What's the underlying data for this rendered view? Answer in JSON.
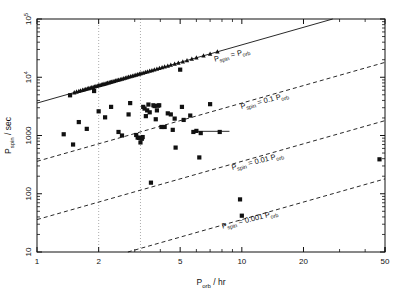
{
  "chart_data": {
    "type": "scatter",
    "title": "",
    "xlabel": "P_orb / hr",
    "ylabel": "P_spin / sec",
    "xlabel_parts": {
      "base": "P",
      "sub": "orb",
      "unit": "/ hr"
    },
    "ylabel_parts": {
      "base": "P",
      "sub": "spin",
      "unit": "/ sec"
    },
    "xscale": "log",
    "yscale": "log",
    "xlim": [
      1,
      50
    ],
    "ylim": [
      10,
      100000
    ],
    "grid": false,
    "legend": "none",
    "xticks": [
      1,
      2,
      5,
      10,
      20,
      50
    ],
    "xticklabels": [
      "1",
      "2",
      "5",
      "10",
      "20",
      "50"
    ],
    "yticks": [
      10,
      100,
      1000,
      10000,
      100000
    ],
    "yticklabels": [
      "10",
      "100",
      "1000",
      "10⁴",
      "10⁵"
    ],
    "annotations": [
      {
        "text": "P_spin = P_orb",
        "base": "P",
        "sub": "spin",
        "op": "=",
        "coef": "",
        "base2": "P",
        "sub2": "orb",
        "x": 9.0,
        "y": 22000,
        "rotation": -14
      },
      {
        "text": "P_spin = 0.1 P_orb",
        "base": "P",
        "sub": "spin",
        "op": "=",
        "coef": "0.1",
        "base2": "P",
        "sub2": "orb",
        "x": 13.0,
        "y": 3600,
        "rotation": -14
      },
      {
        "text": "P_spin = 0.01 P_orb",
        "base": "P",
        "sub": "spin",
        "op": "=",
        "coef": "0.01",
        "base2": "P",
        "sub2": "orb",
        "x": 12.0,
        "y": 330,
        "rotation": -14
      },
      {
        "text": "P_spin = 0.001 P_orb",
        "base": "P",
        "sub": "spin",
        "op": "=",
        "coef": "0.001",
        "base2": "P",
        "sub2": "orb",
        "x": 11.0,
        "y": 33,
        "rotation": -14
      }
    ],
    "reference_lines": [
      {
        "name": "P_spin = P_orb",
        "style": "solid",
        "ratio": 1.0
      },
      {
        "name": "P_spin = 0.1 P_orb",
        "style": "dashed",
        "ratio": 0.1
      },
      {
        "name": "P_spin = 0.01 P_orb",
        "style": "dashed",
        "ratio": 0.01
      },
      {
        "name": "P_spin = 0.001 P_orb",
        "style": "dashed",
        "ratio": 0.001
      }
    ],
    "period_gap": {
      "style": "dotted",
      "x_low": 2.0,
      "x_high": 3.2
    },
    "series": [
      {
        "name": "synchronous systems (triangles)",
        "marker": "triangle",
        "points": [
          [
            1.52,
            5450
          ],
          [
            1.56,
            5620
          ],
          [
            1.6,
            5760
          ],
          [
            1.63,
            5880
          ],
          [
            1.67,
            6020
          ],
          [
            1.7,
            6130
          ],
          [
            1.73,
            6240
          ],
          [
            1.76,
            6340
          ],
          [
            1.79,
            6450
          ],
          [
            1.82,
            6550
          ],
          [
            1.85,
            6660
          ],
          [
            1.88,
            6770
          ],
          [
            1.91,
            6880
          ],
          [
            1.94,
            6990
          ],
          [
            1.97,
            7090
          ],
          [
            2.0,
            7200
          ],
          [
            2.03,
            7310
          ],
          [
            2.06,
            7420
          ],
          [
            2.09,
            7520
          ],
          [
            2.12,
            7630
          ],
          [
            2.15,
            7740
          ],
          [
            2.18,
            7850
          ],
          [
            2.21,
            7960
          ],
          [
            2.25,
            8100
          ],
          [
            2.28,
            8210
          ],
          [
            2.31,
            8320
          ],
          [
            2.35,
            8460
          ],
          [
            2.38,
            8570
          ],
          [
            2.42,
            8710
          ],
          [
            2.46,
            8860
          ],
          [
            2.5,
            9000
          ],
          [
            2.55,
            9180
          ],
          [
            2.6,
            9360
          ],
          [
            2.65,
            9540
          ],
          [
            2.7,
            9720
          ],
          [
            2.75,
            9900
          ],
          [
            2.8,
            10080
          ],
          [
            2.86,
            10300
          ],
          [
            2.92,
            10510
          ],
          [
            2.98,
            10730
          ],
          [
            3.04,
            10940
          ],
          [
            3.1,
            11160
          ],
          [
            3.16,
            11380
          ],
          [
            3.22,
            11590
          ],
          [
            3.3,
            11880
          ],
          [
            3.38,
            12170
          ],
          [
            3.46,
            12460
          ],
          [
            3.55,
            12780
          ],
          [
            3.64,
            13100
          ],
          [
            3.74,
            13460
          ],
          [
            3.85,
            13860
          ],
          [
            3.96,
            14260
          ],
          [
            4.08,
            14690
          ],
          [
            4.2,
            15120
          ],
          [
            4.35,
            15660
          ],
          [
            4.5,
            16200
          ],
          [
            4.7,
            16920
          ],
          [
            4.9,
            17640
          ],
          [
            5.15,
            18540
          ],
          [
            5.4,
            19440
          ],
          [
            5.7,
            20520
          ],
          [
            6.0,
            21600
          ],
          [
            6.5,
            23400
          ],
          [
            7.0,
            25200
          ],
          [
            7.6,
            27360
          ]
        ]
      },
      {
        "name": "intermediate polars / other systems (squares)",
        "marker": "square",
        "points": [
          [
            1.35,
            1050
          ],
          [
            1.45,
            4900
          ],
          [
            1.5,
            700
          ],
          [
            1.6,
            1700
          ],
          [
            1.75,
            1300
          ],
          [
            1.9,
            5800
          ],
          [
            2.0,
            2600
          ],
          [
            2.15,
            2050
          ],
          [
            2.3,
            3100
          ],
          [
            2.5,
            1150
          ],
          [
            2.6,
            1000
          ],
          [
            2.8,
            2300
          ],
          [
            2.85,
            3600
          ],
          [
            3.05,
            1020
          ],
          [
            3.1,
            920
          ],
          [
            3.15,
            910
          ],
          [
            3.2,
            760
          ],
          [
            3.25,
            880
          ],
          [
            3.28,
            940
          ],
          [
            3.3,
            3100
          ],
          [
            3.35,
            2900
          ],
          [
            3.4,
            2150
          ],
          [
            3.45,
            2700
          ],
          [
            3.5,
            3400
          ],
          [
            3.55,
            2500
          ],
          [
            3.6,
            155
          ],
          [
            3.7,
            3300
          ],
          [
            3.75,
            3200
          ],
          [
            3.8,
            1900
          ],
          [
            3.85,
            2700
          ],
          [
            3.9,
            3250
          ],
          [
            3.95,
            3300
          ],
          [
            4.05,
            1400
          ],
          [
            4.2,
            1400
          ],
          [
            4.35,
            2400
          ],
          [
            4.5,
            2300
          ],
          [
            4.6,
            1250
          ],
          [
            4.7,
            1950
          ],
          [
            4.75,
            620
          ],
          [
            5.0,
            13500
          ],
          [
            5.1,
            3100
          ],
          [
            5.2,
            1850
          ],
          [
            5.6,
            2200
          ],
          [
            5.8,
            1150
          ],
          [
            6.0,
            1200
          ],
          [
            6.2,
            420
          ],
          [
            6.3,
            1100
          ],
          [
            7.0,
            3450
          ],
          [
            7.8,
            1150
          ],
          [
            9.8,
            80
          ],
          [
            10.0,
            42
          ],
          [
            47.0,
            390
          ]
        ]
      }
    ],
    "error_bars": [
      {
        "x_start": 6.0,
        "x_end": 8.7,
        "y": 1180,
        "orientation": "horizontal"
      }
    ]
  }
}
